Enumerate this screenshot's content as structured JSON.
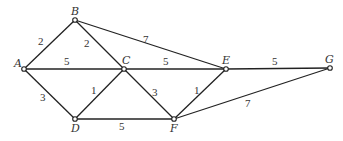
{
  "diagram": {
    "type": "weighted-undirected-graph",
    "colors": {
      "edge": "#222222",
      "node_fill": "#ffffff",
      "text": "#333333",
      "background": "#ffffff"
    },
    "nodes": [
      {
        "id": "A",
        "label": "A",
        "x": 24,
        "y": 69,
        "lx": 14,
        "ly": 67
      },
      {
        "id": "B",
        "label": "B",
        "x": 75,
        "y": 20,
        "lx": 71,
        "ly": 15
      },
      {
        "id": "C",
        "label": "C",
        "x": 124,
        "y": 69,
        "lx": 122,
        "ly": 64
      },
      {
        "id": "D",
        "label": "D",
        "x": 75,
        "y": 119,
        "lx": 71,
        "ly": 132
      },
      {
        "id": "E",
        "label": "E",
        "x": 226,
        "y": 69,
        "lx": 222,
        "ly": 64
      },
      {
        "id": "F",
        "label": "F",
        "x": 174,
        "y": 119,
        "lx": 170,
        "ly": 132
      },
      {
        "id": "G",
        "label": "G",
        "x": 330,
        "y": 68,
        "lx": 325,
        "ly": 63
      }
    ],
    "edges": [
      {
        "from": "A",
        "to": "B",
        "weight": "2",
        "lx": 38,
        "ly": 45
      },
      {
        "from": "A",
        "to": "C",
        "weight": "5",
        "lx": 64,
        "ly": 65
      },
      {
        "from": "A",
        "to": "D",
        "weight": "3",
        "lx": 40,
        "ly": 101
      },
      {
        "from": "B",
        "to": "C",
        "weight": "2",
        "lx": 84,
        "ly": 47
      },
      {
        "from": "B",
        "to": "E",
        "weight": "7",
        "lx": 143,
        "ly": 43
      },
      {
        "from": "C",
        "to": "D",
        "weight": "1",
        "lx": 91,
        "ly": 94
      },
      {
        "from": "C",
        "to": "E",
        "weight": "5",
        "lx": 163,
        "ly": 65
      },
      {
        "from": "C",
        "to": "F",
        "weight": "3",
        "lx": 152,
        "ly": 96
      },
      {
        "from": "D",
        "to": "F",
        "weight": "5",
        "lx": 119,
        "ly": 130
      },
      {
        "from": "E",
        "to": "F",
        "weight": "1",
        "lx": 194,
        "ly": 94
      },
      {
        "from": "E",
        "to": "G",
        "weight": "5",
        "lx": 272,
        "ly": 65
      },
      {
        "from": "F",
        "to": "G",
        "weight": "7",
        "lx": 245,
        "ly": 107
      }
    ]
  }
}
